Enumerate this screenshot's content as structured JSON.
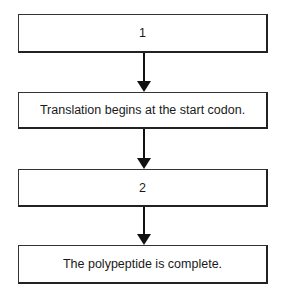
{
  "flowchart": {
    "steps": [
      {
        "label": "1"
      },
      {
        "label": "Translation begins at the start codon."
      },
      {
        "label": "2"
      },
      {
        "label": "The polypeptide is complete."
      }
    ],
    "connectors": [
      {
        "from": 0,
        "to": 1
      },
      {
        "from": 1,
        "to": 2
      },
      {
        "from": 2,
        "to": 3
      }
    ]
  }
}
